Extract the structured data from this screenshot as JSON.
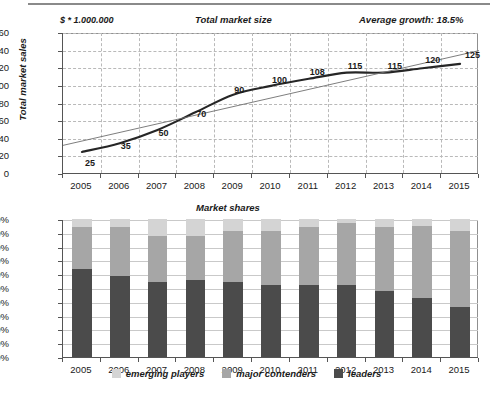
{
  "figure": {
    "divider": "horizontal-rule"
  },
  "chart_data": [
    {
      "type": "line",
      "title": "Total market size",
      "units_label": "$ * 1.000.000",
      "annotation": "Average growth: 18.5%",
      "xlabel": "",
      "ylabel": "Total market sales",
      "categories": [
        "2005",
        "2006",
        "2007",
        "2008",
        "2009",
        "2010",
        "2011",
        "2012",
        "2013",
        "2014",
        "2015"
      ],
      "values": [
        25,
        35,
        50,
        70,
        90,
        100,
        108,
        115,
        115,
        120,
        125
      ],
      "data_labels": [
        "25",
        "35",
        "50",
        "70",
        "90",
        "100",
        "108",
        "115",
        "115",
        "120",
        "125"
      ],
      "ylim": [
        0,
        160
      ],
      "yticks": [
        "0",
        "20",
        "40",
        "60",
        "80",
        "100",
        "120",
        "140",
        "160"
      ],
      "grid": true,
      "series": [
        {
          "name": "Total market sales",
          "style": "solid-thick",
          "values": [
            25,
            35,
            50,
            70,
            90,
            100,
            108,
            115,
            115,
            120,
            125
          ]
        },
        {
          "name": "trendline",
          "style": "thin-straight",
          "values": [
            35,
            45.5,
            56,
            66.5,
            77,
            87.5,
            98,
            108.5,
            119,
            129.5,
            140
          ]
        }
      ]
    },
    {
      "type": "bar",
      "subtype": "stacked-100",
      "title": "Market shares",
      "xlabel": "",
      "ylabel": "",
      "categories": [
        "2005",
        "2006",
        "2007",
        "2008",
        "2009",
        "2010",
        "2011",
        "2012",
        "2013",
        "2014",
        "2015"
      ],
      "ylim": [
        0,
        100
      ],
      "yticks": [
        "0%",
        "10%",
        "20%",
        "30%",
        "40%",
        "50%",
        "60%",
        "70%",
        "80%",
        "90%",
        "100%"
      ],
      "grid": true,
      "legend_position": "bottom",
      "series": [
        {
          "name": "leaders",
          "color": "#4b4b4b",
          "values": [
            64,
            59,
            54,
            56,
            54,
            52,
            52,
            52,
            48,
            43,
            36
          ]
        },
        {
          "name": "major contenders",
          "color": "#a6a6a6",
          "values": [
            30,
            35,
            34,
            32,
            37,
            39,
            42,
            45,
            46,
            52,
            55
          ]
        },
        {
          "name": "emerging players",
          "color": "#d4d4d4",
          "values": [
            6,
            6,
            12,
            12,
            9,
            9,
            6,
            3,
            6,
            5,
            9
          ]
        }
      ],
      "legend_order": [
        "emerging players",
        "major contenders",
        "leaders"
      ]
    }
  ]
}
